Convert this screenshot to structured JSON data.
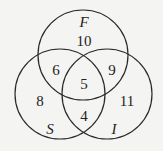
{
  "diagram": {
    "type": "venn",
    "sets": [
      {
        "label": "F",
        "cx": 83,
        "cy": 55,
        "r": 45
      },
      {
        "label": "S",
        "cx": 60,
        "cy": 94,
        "r": 45
      },
      {
        "label": "I",
        "cx": 107,
        "cy": 94,
        "r": 45
      }
    ],
    "regions": {
      "F_only": "10",
      "F_S": "6",
      "F_I": "9",
      "F_S_I": "5",
      "S_only": "8",
      "I_only": "11",
      "S_I": "4"
    }
  }
}
